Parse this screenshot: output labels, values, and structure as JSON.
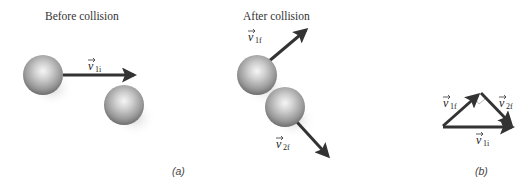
{
  "panels": {
    "a": {
      "label": "(a)",
      "before": {
        "title": "Before collision",
        "velocity_label": {
          "symbol": "v",
          "subscript": "1i"
        }
      },
      "after": {
        "title": "After collision",
        "velocity_1": {
          "symbol": "v",
          "subscript": "1f"
        },
        "velocity_2": {
          "symbol": "v",
          "subscript": "2f"
        }
      }
    },
    "b": {
      "label": "(b)",
      "vectors": [
        {
          "symbol": "v",
          "subscript": "1f"
        },
        {
          "symbol": "v",
          "subscript": "2f"
        },
        {
          "symbol": "v",
          "subscript": "1i"
        }
      ]
    }
  },
  "colors": {
    "arrow": "#333333",
    "sphere_light": "#f4f4f4",
    "sphere_mid": "#a8a8a8",
    "sphere_dark": "#6a6a6a",
    "shadow": "#d8d8d8"
  }
}
